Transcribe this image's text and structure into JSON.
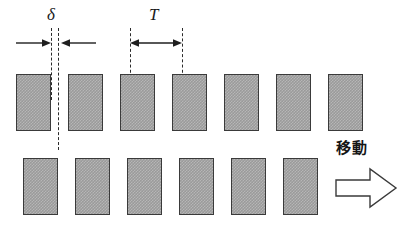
{
  "figure": {
    "width": 404,
    "height": 239,
    "background": "#ffffff"
  },
  "annotations": {
    "delta": {
      "label": "δ",
      "name": "offset-between-rows",
      "span_px": 7,
      "arrow_style": "inward-facing-pair"
    },
    "period": {
      "label": "T",
      "name": "grating-period",
      "span_px": 52,
      "arrow_style": "double-headed"
    },
    "motion": {
      "label": "移動",
      "name": "movement-direction",
      "direction": "right"
    }
  },
  "style": {
    "block_fill": "#9a9a9a",
    "block_hatch": "#b6b6b6",
    "block_border": "#3a3a3a",
    "line_color": "#2b2b2b",
    "text_color": "#1a1a1a"
  },
  "geometry": {
    "period": 52,
    "block_width": 35,
    "offset": 7,
    "top_row": {
      "y": 74,
      "height": 57,
      "x_start": 16,
      "count": 7
    },
    "bottom_row": {
      "y": 158,
      "height": 57,
      "x_start": 23,
      "count": 6
    },
    "dash_lines": [
      {
        "x": 51,
        "y": 28,
        "height": 72
      },
      {
        "x": 58,
        "y": 28,
        "height": 122
      },
      {
        "x": 130,
        "y": 28,
        "height": 50
      },
      {
        "x": 182,
        "y": 28,
        "height": 50
      }
    ]
  },
  "top_row_blocks": [
    {
      "x": 16
    },
    {
      "x": 68
    },
    {
      "x": 120
    },
    {
      "x": 172
    },
    {
      "x": 224
    },
    {
      "x": 276
    },
    {
      "x": 328
    }
  ],
  "bottom_row_blocks": [
    {
      "x": 23
    },
    {
      "x": 75
    },
    {
      "x": 127
    },
    {
      "x": 179
    },
    {
      "x": 231
    },
    {
      "x": 283
    }
  ]
}
